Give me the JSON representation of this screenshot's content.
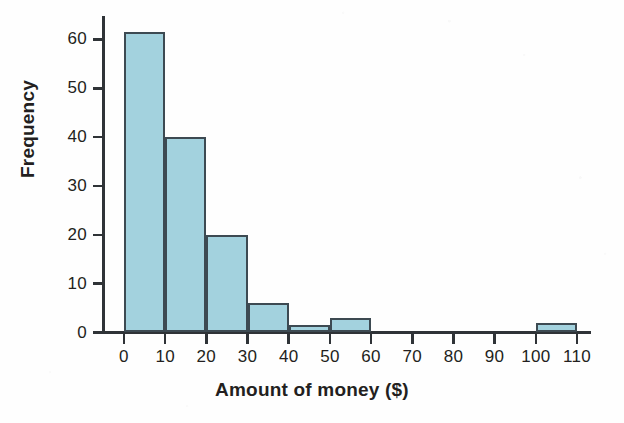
{
  "chart_data": {
    "type": "bar",
    "title": "",
    "subtitle": "",
    "xlabel": "Amount of money ($)",
    "ylabel": "Frequency",
    "bin_width": 10,
    "categories": [
      "0-10",
      "10-20",
      "20-30",
      "30-40",
      "40-50",
      "50-60",
      "60-70",
      "70-80",
      "80-90",
      "90-100",
      "100-110"
    ],
    "bin_edges": [
      0,
      10,
      20,
      30,
      40,
      50,
      60,
      70,
      80,
      90,
      100,
      110
    ],
    "values": [
      61.5,
      40,
      20,
      6,
      1.5,
      3,
      0,
      0,
      0,
      0,
      2
    ],
    "xlim": [
      0,
      110
    ],
    "ylim": [
      0,
      65
    ],
    "x_ticks": [
      0,
      10,
      20,
      30,
      40,
      50,
      60,
      70,
      80,
      90,
      100,
      110
    ],
    "x_tick_labels": [
      "0",
      "10",
      "20",
      "30",
      "40",
      "50",
      "60",
      "70",
      "80",
      "90",
      "100",
      "110"
    ],
    "y_ticks": [
      0,
      10,
      20,
      30,
      40,
      50,
      60
    ],
    "y_tick_labels": [
      "0",
      "10",
      "20",
      "30",
      "40",
      "50",
      "60"
    ],
    "grid": false,
    "legend": null,
    "colors": {
      "bar_fill": "#a3d2de",
      "bar_border": "#3d4a52",
      "axis": "#2f3337",
      "text": "#231f20",
      "background": "#fefefe"
    }
  }
}
